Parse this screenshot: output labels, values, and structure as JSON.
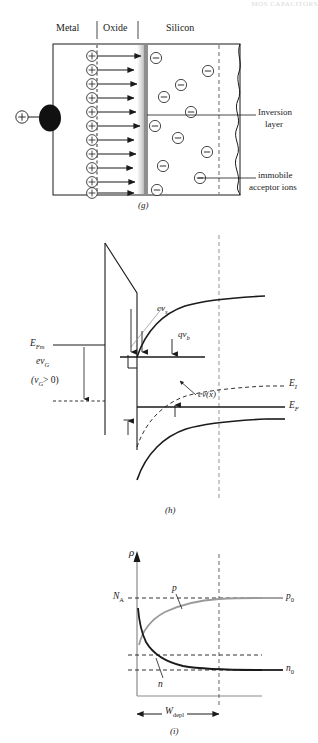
{
  "header": {
    "running_head": "MOS CAPACITORS"
  },
  "figure": {
    "panels": [
      {
        "id": "g",
        "id_label": "(g)",
        "region_labels": [
          "Metal",
          "Oxide",
          "Silicon"
        ],
        "terminal_charge": "+",
        "mobile_charge_symbol": "+",
        "inversion_charge_symbol": "−",
        "annotations": [
          {
            "name": "inversion-layer",
            "line1": "Inversion",
            "line2": "layer"
          },
          {
            "name": "immobile-acceptor-ions",
            "line1": "immobile",
            "line2": "acceptor ions"
          }
        ],
        "plus_ion_count": 11,
        "minus_ion_count": 11
      },
      {
        "id": "h",
        "id_label": "(h)",
        "labels": {
          "ev_s": "ev",
          "ev_s_sub": "s",
          "E_Fm": "E",
          "E_Fm_sub": "Fm",
          "ev_G": "ev",
          "ev_G_sub": "G",
          "vG_condition": "(v",
          "vG_condition_sub": "G",
          "vG_condition_tail": "> 0)",
          "qv_b": "qv",
          "qv_b_sub": "b",
          "ev_x": "ev(x)",
          "E_I": "E",
          "E_I_sub": "I",
          "E_F": "E",
          "E_F_sub": "F"
        }
      },
      {
        "id": "i",
        "id_label": "(i)",
        "labels": {
          "rho": "ρ",
          "N_A": "N",
          "N_A_sub": "A",
          "p": "p",
          "p0": "p",
          "p0_sub": "0",
          "n": "n",
          "n0": "n",
          "n0_sub": "0",
          "W_depl": "W",
          "W_depl_sub": "depl"
        }
      }
    ]
  },
  "colors": {
    "ink": "#1a1a1a",
    "oxide_gradient_dark": "#8c8c8c",
    "oxide_gradient_light": "#d6d6d6",
    "grey_curve": "#9a9a9a",
    "dashed": "#555555",
    "axis_grey": "#8a8a8a"
  }
}
